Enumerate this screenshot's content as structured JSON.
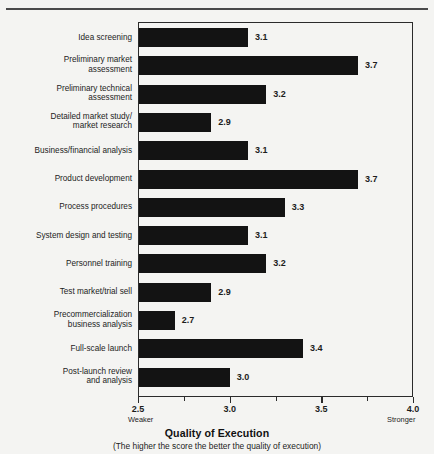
{
  "chart_data": {
    "type": "bar",
    "orientation": "horizontal",
    "title": "",
    "xlabel": "Quality of Execution",
    "caption": "(The higher the score the better the quality of execution)",
    "ylabel": "",
    "xlim": [
      2.5,
      4.0
    ],
    "xticks": [
      2.5,
      3.0,
      3.5,
      4.0
    ],
    "xtick_labels": [
      "2.5",
      "3.0",
      "3.5",
      "4.0"
    ],
    "xtick_minor": [
      2.75,
      3.25,
      3.75
    ],
    "axis_end_labels": {
      "low": "Weaker",
      "high": "Stronger"
    },
    "grid": false,
    "legend": false,
    "bar_color": "#131313",
    "categories": [
      "Idea screening",
      "Preliminary market\nassessment",
      "Preliminary technical\nassessment",
      "Detailed market study/\nmarket research",
      "Business/financial analysis",
      "Product development",
      "Process procedures",
      "System design and testing",
      "Personnel training",
      "Test market/trial sell",
      "Precommercialization\nbusiness analysis",
      "Full-scale launch",
      "Post-launch review\nand analysis"
    ],
    "values": [
      3.1,
      3.7,
      3.2,
      2.9,
      3.1,
      3.7,
      3.3,
      3.1,
      3.2,
      2.9,
      2.7,
      3.4,
      3.0
    ],
    "value_labels": [
      "3.1",
      "3.7",
      "3.2",
      "2.9",
      "3.1",
      "3.7",
      "3.3",
      "3.1",
      "3.2",
      "2.9",
      "2.7",
      "3.4",
      "3.0"
    ]
  }
}
